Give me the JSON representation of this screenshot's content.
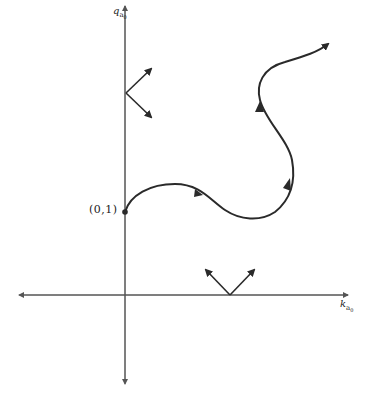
{
  "diagram": {
    "axes": {
      "x_label": "k",
      "x_subscript": "a",
      "x_subsubscript": "0",
      "y_label": "q",
      "y_subscript": "a",
      "y_subsubscript": "0"
    },
    "start_point": {
      "label": "(0,1)"
    },
    "colors": {
      "stroke": "#2a2a2a",
      "axis": "#555555",
      "background": "#ffffff"
    },
    "elements": [
      "horizontal axis with arrowheads at both ends",
      "vertical axis with arrowheads at both ends",
      "V-shaped vector pair on vertical axis (one up-right, one down-right)",
      "V-shaped vector pair on horizontal axis (one up-left, one up-right)",
      "trajectory curve from (0,1) with direction arrows ending in arrowhead at upper right"
    ]
  }
}
